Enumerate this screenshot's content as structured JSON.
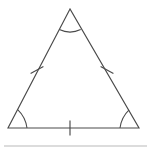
{
  "figure": {
    "kind": "equilateral-triangle-diagram",
    "background_color": "#ffffff",
    "stroke_color": "#4a4a4a",
    "rule_color": "#b9b9b9",
    "canvas": {
      "width": 150,
      "height": 153
    },
    "vertices": {
      "apex": {
        "label": "",
        "x": 70,
        "y": 9
      },
      "bottom_left": {
        "label": "",
        "x": 8,
        "y": 128
      },
      "bottom_right": {
        "label": "",
        "x": 139,
        "y": 128
      }
    },
    "sides": [
      {
        "name": "left-side",
        "from": "bottom_left",
        "to": "apex",
        "tick_count": 1,
        "tick_center_x": 37,
        "tick_center_y": 70
      },
      {
        "name": "right-side",
        "from": "apex",
        "to": "bottom_right",
        "tick_count": 1,
        "tick_center_x": 107,
        "tick_center_y": 70
      },
      {
        "name": "base-side",
        "from": "bottom_left",
        "to": "bottom_right",
        "tick_count": 1,
        "tick_center_x": 70,
        "tick_center_y": 128
      }
    ],
    "angle_marks": [
      {
        "name": "apex-angle-arc",
        "at": "apex",
        "arc_count": 1,
        "radius": 21
      },
      {
        "name": "bottom-left-angle-arc",
        "at": "bottom_left",
        "arc_count": 1,
        "radius": 19
      },
      {
        "name": "bottom-right-angle-arc",
        "at": "bottom_right",
        "arc_count": 1,
        "radius": 19
      }
    ],
    "bottom_rule": {
      "name": "horizontal-rule",
      "x1": 4,
      "x2": 147,
      "y": 146
    },
    "labels": []
  },
  "paths": {
    "triangle_outline": "M 70 9 L 8 128 L 139 128 Z",
    "apex_arc": "M 59.3 29.6 Q 70 34.6 80.7 29.6",
    "bottom_left_arc": "M 27 128 Q 25.6 117.1 17.9 109.8",
    "bottom_right_arc": "M 129.1 109.8 Q 121.4 117.1 120 128",
    "left_tick": "M 30.6 73.6 L 43.4 66.4",
    "right_tick": "M 100.6 66.4 L 113.4 73.6",
    "base_tick": "M 70 120.5 L 70 135.5",
    "bottom_rule_line": "M 4 146 L 147 146"
  }
}
